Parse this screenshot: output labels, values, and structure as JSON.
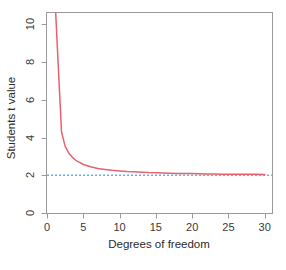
{
  "chart_data": {
    "type": "line",
    "title": "",
    "xlabel": "Degrees of freedom",
    "ylabel": "Students t value",
    "xlim": [
      0,
      31
    ],
    "ylim": [
      0,
      10.6
    ],
    "xticks": [
      0,
      5,
      10,
      15,
      20,
      25,
      30
    ],
    "xtick_labels": [
      "0",
      "5",
      "10",
      "15",
      "20",
      "25",
      "30"
    ],
    "yticks": [
      0,
      2,
      4,
      6,
      8,
      10
    ],
    "ytick_labels": [
      "0",
      "2",
      "4",
      "6",
      "8",
      "10"
    ],
    "grid": false,
    "legend": "none",
    "series": [
      {
        "name": "Students t critical value",
        "color": "#e8616c",
        "style": "solid",
        "x": [
          1,
          1.2,
          1.5,
          2,
          2.5,
          3,
          3.5,
          4,
          4.5,
          5,
          6,
          7,
          8,
          9,
          10,
          11,
          12,
          13,
          14,
          15,
          16,
          17,
          18,
          19,
          20,
          21,
          22,
          23,
          24,
          25,
          26,
          27,
          28,
          29,
          30
        ],
        "values": [
          12.71,
          10.6,
          8.2,
          4.3,
          3.53,
          3.18,
          2.95,
          2.78,
          2.68,
          2.57,
          2.45,
          2.36,
          2.31,
          2.26,
          2.23,
          2.2,
          2.18,
          2.16,
          2.14,
          2.13,
          2.12,
          2.11,
          2.1,
          2.09,
          2.09,
          2.08,
          2.07,
          2.07,
          2.06,
          2.06,
          2.06,
          2.05,
          2.05,
          2.05,
          2.04
        ]
      },
      {
        "name": "Asymptote reference line",
        "color": "#63b8e8",
        "style": "dotted",
        "constant_y": 2
      }
    ]
  },
  "axes": {
    "x_title": "Degrees of freedom",
    "y_title": "Students t value"
  },
  "colors": {
    "curve": "#e8616c",
    "reference_line": "#63b8e8",
    "frame": "#9a9a9a",
    "text": "#3a3a3a",
    "background": "#ffffff"
  }
}
